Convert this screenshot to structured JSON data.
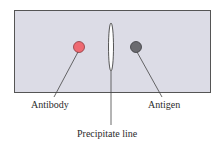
{
  "diagram": {
    "colors": {
      "gel": "#dcdce6",
      "gel_border": "#555555",
      "antibody": "#ee6a72",
      "antigen": "#6b6b70",
      "line": "#444444"
    },
    "labels": {
      "antibody": "Antibody",
      "antigen": "Antigen",
      "precipitate": "Precipitate line"
    }
  }
}
